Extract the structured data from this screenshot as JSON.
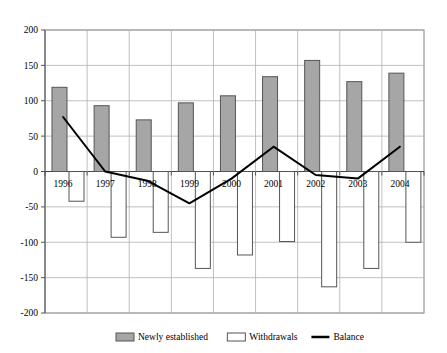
{
  "chart_data": {
    "type": "bar",
    "title": "",
    "subtitle": "",
    "xlabel": "",
    "ylabel": "",
    "categories": [
      "1996",
      "1997",
      "1998",
      "1999",
      "2000",
      "2001",
      "2002",
      "2003",
      "2004"
    ],
    "ylim": [
      -200,
      200
    ],
    "yticks": [
      200,
      150,
      100,
      50,
      0,
      -50,
      -100,
      -150,
      -200
    ],
    "ytick_labels": [
      "200",
      "150",
      "100",
      "50",
      "0",
      "-50",
      "-100",
      "-150",
      "-200"
    ],
    "grid": true,
    "grid_axis": "y",
    "legend_position": "bottom",
    "series": [
      {
        "name": "Newly established",
        "type": "bar",
        "fill": "#a6a6a6",
        "stroke": "#555555",
        "values": [
          119,
          93,
          73,
          97,
          107,
          134,
          157,
          127,
          139
        ]
      },
      {
        "name": "Withdrawals",
        "type": "bar",
        "fill": "#ffffff",
        "stroke": "#555555",
        "values": [
          -42,
          -93,
          -86,
          -137,
          -118,
          -99,
          -163,
          -137,
          -100
        ]
      },
      {
        "name": "Balance",
        "type": "line",
        "stroke": "#000000",
        "values": [
          77,
          0,
          -13,
          -45,
          -10,
          35,
          -5,
          -10,
          35
        ]
      }
    ]
  },
  "legend": {
    "items": [
      {
        "label": "Newly established",
        "swatch": "filled-gray-swatch"
      },
      {
        "label": "Withdrawals",
        "swatch": "outline-white-swatch"
      },
      {
        "label": "Balance",
        "swatch": "black-line-swatch"
      }
    ]
  },
  "axes": {
    "y_axis_name": "value-axis",
    "x_axis_name": "year-axis"
  },
  "colors": {
    "plot_border": "#808080",
    "gridline": "#b0b0b0",
    "bar_newly_established_fill": "#a6a6a6",
    "bar_withdrawals_fill": "#ffffff",
    "bar_stroke": "#555555",
    "balance_line": "#000000",
    "background": "#ffffff"
  }
}
